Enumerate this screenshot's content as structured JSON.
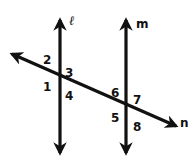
{
  "diagram": {
    "colors": {
      "stroke": "#111111",
      "background": "#ffffff"
    },
    "lines": {
      "l": {
        "label": "ℓ"
      },
      "m": {
        "label": "m"
      },
      "n": {
        "label": "n"
      }
    },
    "angles": {
      "a1": "1",
      "a2": "2",
      "a3": "3",
      "a4": "4",
      "a5": "5",
      "a6": "6",
      "a7": "7",
      "a8": "8"
    }
  }
}
